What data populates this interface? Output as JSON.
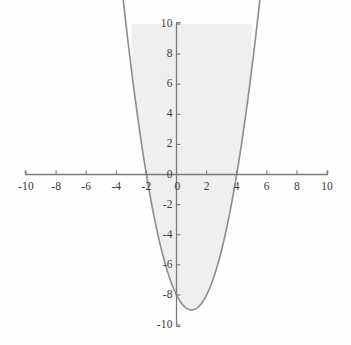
{
  "chart_data": {
    "type": "line",
    "title": "",
    "subtitle": "",
    "xlabel": "",
    "ylabel": "",
    "xlim": [
      -10,
      10
    ],
    "ylim": [
      -10,
      10
    ],
    "grid": false,
    "legend": null,
    "axes_style": {
      "x_axis_at_y": 0,
      "y_axis_at_x": 0,
      "tick_direction_x": "up",
      "tick_direction_y": "right",
      "tick_interval": 2
    },
    "colors": {
      "curve": "#8c8c8c",
      "fill": "#efefef",
      "axis": "#7a7a7a",
      "text": "#3a3a3a",
      "background": "#fefefe"
    },
    "x_ticks": [
      -10,
      -8,
      -6,
      -4,
      -2,
      0,
      2,
      4,
      6,
      8,
      10
    ],
    "y_ticks": [
      -10,
      -8,
      -6,
      -4,
      -2,
      0,
      2,
      4,
      6,
      8,
      10
    ],
    "x_tick_labels": [
      "-10",
      "-8",
      "-6",
      "-4",
      "-2",
      "0",
      "2",
      "4",
      "6",
      "8",
      "10"
    ],
    "y_tick_labels": [
      "-10",
      "-8",
      "-6",
      "-4",
      "-2",
      "0",
      "2",
      "4",
      "6",
      "8",
      "10"
    ],
    "series": [
      {
        "name": "parabola",
        "equation": "y = x^2 - 2x - 8",
        "roots": [
          -2,
          4
        ],
        "vertex": [
          1,
          -9
        ],
        "filled": true,
        "fill_description": "region bounded above by y = 10 and below by the parabola",
        "x": [
          -3.0,
          -2.8,
          -2.6,
          -2.4,
          -2.2,
          -2.0,
          -1.8,
          -1.6,
          -1.4,
          -1.2,
          -1.0,
          -0.8,
          -0.6,
          -0.4,
          -0.2,
          0.0,
          0.2,
          0.4,
          0.6,
          0.8,
          1.0,
          1.2,
          1.4,
          1.6,
          1.8,
          2.0,
          2.2,
          2.4,
          2.6,
          2.8,
          3.0,
          3.2,
          3.4,
          3.6,
          3.8,
          4.0,
          4.2,
          4.4,
          4.6,
          4.8,
          5.0
        ],
        "y": [
          7.0,
          5.44,
          3.96,
          2.56,
          1.24,
          0.0,
          -1.16,
          -2.24,
          -3.24,
          -4.16,
          -5.0,
          -5.76,
          -6.44,
          -7.04,
          -7.56,
          -8.0,
          -8.36,
          -8.64,
          -8.84,
          -8.96,
          -9.0,
          -8.96,
          -8.84,
          -8.64,
          -8.36,
          -8.0,
          -7.56,
          -7.04,
          -6.44,
          -5.76,
          -5.0,
          -4.16,
          -3.24,
          -2.24,
          -1.16,
          0.0,
          1.24,
          2.56,
          3.96,
          5.44,
          7.0
        ]
      }
    ],
    "annotations": []
  }
}
